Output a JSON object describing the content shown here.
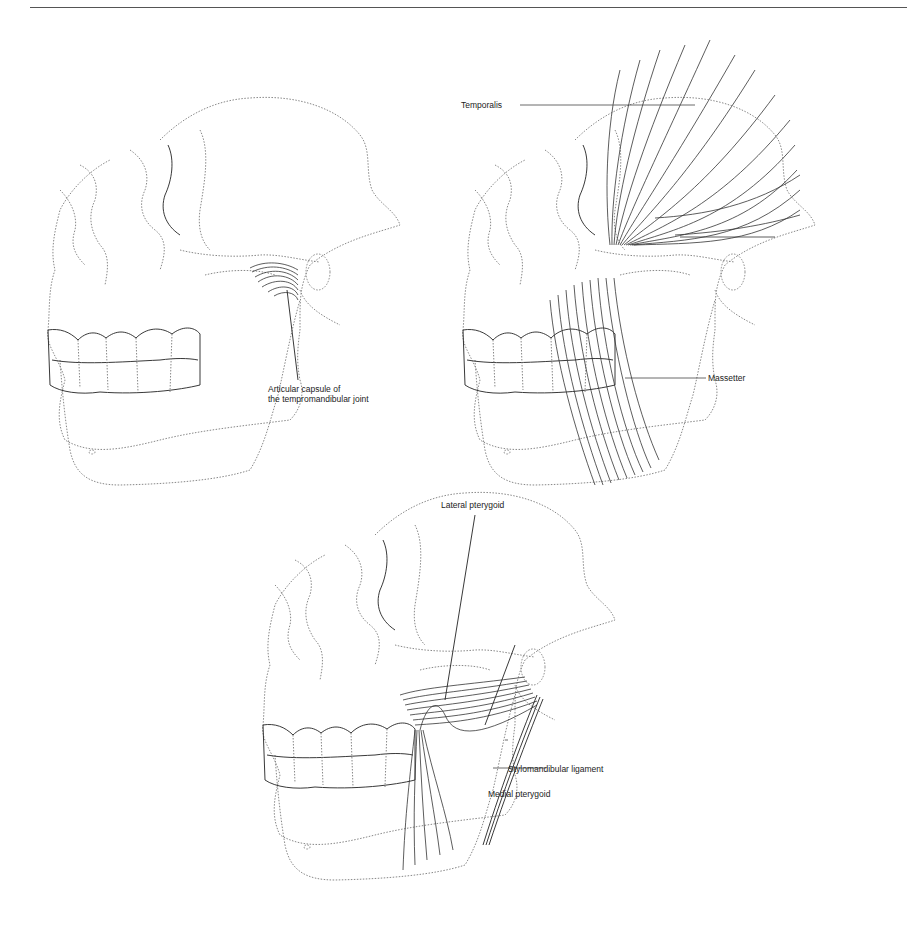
{
  "figures": [
    {
      "id": "joint",
      "labels": {
        "articular_capsule_line1": "Articular capsule of",
        "articular_capsule_line2": "the tempromandibular joint"
      }
    },
    {
      "id": "temporalis-masseter",
      "labels": {
        "temporalis": "Temporalis",
        "massetter": "Massetter"
      }
    },
    {
      "id": "pterygoids",
      "labels": {
        "lateral_pterygoid": "Lateral pterygoid",
        "stylomandibular_ligament": "Stylomandibular ligament",
        "medial_pterygoid": "Medial pterygoid"
      }
    }
  ]
}
